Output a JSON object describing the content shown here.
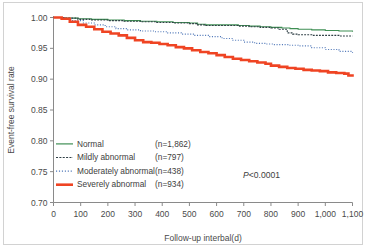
{
  "chart_data": {
    "type": "line",
    "title": "",
    "xlabel": "Follow-up interbal(d)",
    "ylabel": "Event-free survival rate",
    "xlim": [
      0,
      1100
    ],
    "ylim": [
      0.7,
      1.0
    ],
    "xticks": [
      0,
      100,
      200,
      300,
      400,
      500,
      600,
      700,
      800,
      900,
      1000,
      1100
    ],
    "xticklabels": [
      "0",
      "100",
      "200",
      "300",
      "400",
      "500",
      "600",
      "700",
      "800",
      "900",
      "1,000",
      "1,100"
    ],
    "yticks": [
      0.7,
      0.75,
      0.8,
      0.85,
      0.9,
      0.95,
      1.0
    ],
    "yticklabels": [
      "0.70",
      "0.75",
      "0.80",
      "0.85",
      "0.90",
      "0.95",
      "1.00"
    ],
    "grid": false,
    "legend_position": "lower-left",
    "annotation": "P<0.0001",
    "annotation_prefix": "P",
    "annotation_rest": "<0.0001",
    "series": [
      {
        "name": "Normal",
        "n_label": "(n=1,862)",
        "n": 1862,
        "color": "#3f8f54",
        "style": "solid",
        "width": 1.1,
        "x": [
          0,
          40,
          90,
          140,
          200,
          260,
          320,
          380,
          440,
          500,
          530,
          560,
          620,
          680,
          720,
          760,
          800,
          840,
          870,
          900,
          950,
          1000,
          1050,
          1100
        ],
        "y": [
          1.0,
          0.999,
          0.998,
          0.997,
          0.996,
          0.995,
          0.994,
          0.993,
          0.992,
          0.991,
          0.989,
          0.988,
          0.988,
          0.987,
          0.986,
          0.985,
          0.984,
          0.983,
          0.982,
          0.981,
          0.98,
          0.979,
          0.978,
          0.977
        ]
      },
      {
        "name": "Mildly abnormal",
        "n_label": "(n=797)",
        "n": 797,
        "color": "#2f3f45",
        "style": "dashed",
        "width": 1.1,
        "x": [
          0,
          40,
          90,
          140,
          200,
          260,
          320,
          380,
          440,
          500,
          530,
          560,
          620,
          680,
          720,
          760,
          800,
          830,
          860,
          880,
          900,
          950,
          1000,
          1050,
          1100
        ],
        "y": [
          1.0,
          0.999,
          0.997,
          0.996,
          0.995,
          0.994,
          0.993,
          0.992,
          0.991,
          0.99,
          0.988,
          0.987,
          0.987,
          0.986,
          0.985,
          0.984,
          0.983,
          0.981,
          0.975,
          0.973,
          0.972,
          0.971,
          0.971,
          0.97,
          0.97
        ]
      },
      {
        "name": "Moderately abnormal",
        "n_label": "(n=438)",
        "n": 438,
        "color": "#4f77b8",
        "style": "dotted",
        "width": 1.1,
        "x": [
          0,
          40,
          70,
          110,
          150,
          190,
          230,
          270,
          320,
          370,
          420,
          470,
          520,
          570,
          620,
          660,
          700,
          740,
          780,
          810,
          840,
          870,
          900,
          950,
          1000,
          1050,
          1100
        ],
        "y": [
          1.0,
          0.998,
          0.995,
          0.991,
          0.988,
          0.985,
          0.982,
          0.98,
          0.978,
          0.977,
          0.975,
          0.973,
          0.971,
          0.969,
          0.966,
          0.963,
          0.96,
          0.958,
          0.957,
          0.956,
          0.956,
          0.955,
          0.954,
          0.951,
          0.948,
          0.945,
          0.943
        ]
      },
      {
        "name": "Severely abnormal",
        "n_label": "(n=934)",
        "n": 934,
        "color": "#ef4423",
        "style": "solid",
        "width": 2.6,
        "x": [
          0,
          30,
          60,
          90,
          120,
          150,
          180,
          210,
          240,
          270,
          300,
          330,
          360,
          390,
          420,
          450,
          480,
          510,
          540,
          570,
          600,
          630,
          660,
          690,
          720,
          750,
          780,
          800,
          830,
          860,
          890,
          920,
          950,
          980,
          1010,
          1040,
          1070,
          1085,
          1100
        ],
        "y": [
          1.0,
          0.998,
          0.993,
          0.988,
          0.985,
          0.981,
          0.977,
          0.974,
          0.971,
          0.967,
          0.963,
          0.96,
          0.959,
          0.957,
          0.955,
          0.952,
          0.95,
          0.947,
          0.944,
          0.942,
          0.939,
          0.936,
          0.933,
          0.931,
          0.929,
          0.927,
          0.925,
          0.922,
          0.92,
          0.918,
          0.917,
          0.915,
          0.914,
          0.913,
          0.911,
          0.91,
          0.909,
          0.906,
          0.904
        ]
      }
    ]
  }
}
